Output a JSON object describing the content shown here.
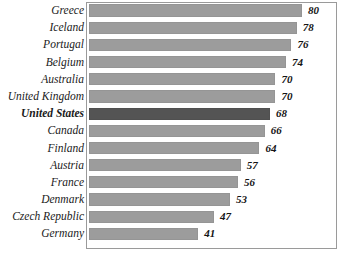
{
  "chart_data": {
    "type": "bar",
    "orientation": "horizontal",
    "title": "",
    "subtitle": "",
    "xlabel": "",
    "ylabel": "",
    "xlim": [
      0,
      80
    ],
    "grid": false,
    "legend": null,
    "highlight_category": "United States",
    "colors": {
      "bar": "#9c9c9c",
      "bar_highlight": "#545454",
      "border": "#9a9a9a",
      "background": "#ffffff",
      "text": "#1a1a1a"
    },
    "categories": [
      "Greece",
      "Iceland",
      "Portugal",
      "Belgium",
      "Australia",
      "United Kingdom",
      "United States",
      "Canada",
      "Finland",
      "Austria",
      "France",
      "Denmark",
      "Czech Republic",
      "Germany"
    ],
    "values": [
      80,
      78,
      76,
      74,
      70,
      70,
      68,
      66,
      64,
      57,
      56,
      53,
      47,
      41
    ],
    "value_labels": [
      "80",
      "78",
      "76",
      "74",
      "70",
      "70",
      "68",
      "66",
      "64",
      "57",
      "56",
      "53",
      "47",
      "41"
    ]
  }
}
